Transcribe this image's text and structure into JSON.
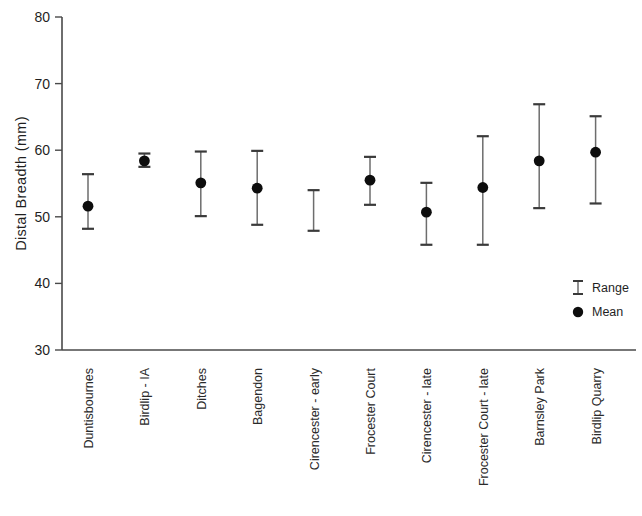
{
  "chart_data": {
    "type": "scatter",
    "title": "",
    "xlabel": "",
    "ylabel": "Distal Breadth (mm)",
    "ylim": [
      30,
      80
    ],
    "yticks": [
      30,
      40,
      50,
      60,
      70,
      80
    ],
    "ytick_labels": [
      "30",
      "40",
      "50",
      "60",
      "70",
      "80"
    ],
    "grid": false,
    "legend_position": "bottom-right",
    "legend": [
      {
        "label": "Range",
        "marker": "i-bar"
      },
      {
        "label": "Mean",
        "marker": "filled-circle"
      }
    ],
    "categories": [
      "Duntisbournes",
      "Birdlip - IA",
      "Ditches",
      "Bagendon",
      "Cirencester - early",
      "Frocester Court",
      "Cirencester - late",
      "Frocester Court - late",
      "Barnsley Park",
      "Birdlip Quarry"
    ],
    "series": [
      {
        "name": "Mean",
        "values": [
          51.6,
          58.4,
          55.1,
          54.3,
          null,
          55.5,
          50.7,
          54.4,
          58.4,
          59.7
        ]
      },
      {
        "name": "Range low",
        "values": [
          48.2,
          57.5,
          50.1,
          48.8,
          47.9,
          51.8,
          45.8,
          45.8,
          51.3,
          52.0
        ]
      },
      {
        "name": "Range high",
        "values": [
          56.4,
          59.5,
          59.8,
          59.9,
          54.0,
          59.0,
          55.1,
          62.1,
          66.9,
          65.1
        ]
      }
    ],
    "points": [
      {
        "category": "Duntisbournes",
        "mean": 51.6,
        "low": 48.2,
        "high": 56.4
      },
      {
        "category": "Birdlip - IA",
        "mean": 58.4,
        "low": 57.5,
        "high": 59.5
      },
      {
        "category": "Ditches",
        "mean": 55.1,
        "low": 50.1,
        "high": 59.8
      },
      {
        "category": "Bagendon",
        "mean": 54.3,
        "low": 48.8,
        "high": 59.9
      },
      {
        "category": "Cirencester - early",
        "mean": null,
        "low": 47.9,
        "high": 54.0
      },
      {
        "category": "Frocester Court",
        "mean": 55.5,
        "low": 51.8,
        "high": 59.0
      },
      {
        "category": "Cirencester - late",
        "mean": 50.7,
        "low": 45.8,
        "high": 55.1
      },
      {
        "category": "Frocester Court - late",
        "mean": 54.4,
        "low": 45.8,
        "high": 62.1
      },
      {
        "category": "Barnsley Park",
        "mean": 58.4,
        "low": 51.3,
        "high": 66.9
      },
      {
        "category": "Birdlip Quarry",
        "mean": 59.7,
        "low": 52.0,
        "high": 65.1
      }
    ]
  },
  "colors": {
    "axis": "#4a4a4a",
    "stem": "#6d6d6d",
    "cap": "#3a3a3a",
    "marker": "#0d0d0d",
    "text": "#1f1f1f",
    "background": "#ffffff"
  }
}
